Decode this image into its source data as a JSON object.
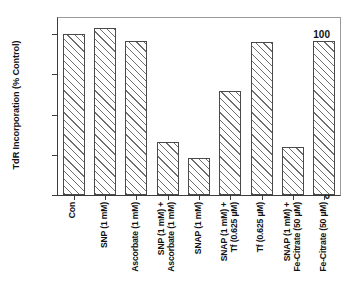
{
  "chart_data": {
    "type": "bar",
    "title": "",
    "xlabel": "",
    "ylabel": "TdR Incorporation (% Control)",
    "ylim": [
      0,
      110
    ],
    "yticks": [
      0,
      25,
      50,
      75,
      100
    ],
    "ytick_labels": [
      "0",
      "25",
      "50",
      "75",
      "100"
    ],
    "grid": false,
    "legend": null,
    "bar_fill": "white-with-diagonal-hatch",
    "categories": [
      "Con",
      "SNP (1 mM)",
      "Ascorbate (1 mM)",
      "SNP (1 mM) +\nAscorbate (1 mM)",
      "SNAP (1 mM)",
      "SNAP (1 mM) +\nTf (0.625 µM)",
      "Tf (0.625 µM)",
      "SNAP (1 mM) +\nFe-Citrate (50 µM)",
      "Fe-Citrate (50 µM)"
    ],
    "category_lines": [
      [
        "Con"
      ],
      [
        "SNP (1 mM)"
      ],
      [
        "Ascorbate (1 mM)"
      ],
      [
        "SNP (1 mM)  +",
        "Ascorbate (1 mM)"
      ],
      [
        "SNAP (1 mM)"
      ],
      [
        "SNAP (1 mM)  +",
        "Tf (0.625 µM)"
      ],
      [
        "Tf (0.625 µM)"
      ],
      [
        "SNAP (1 mM)  +",
        "Fe-Citrate (50 µM)"
      ],
      [
        "Fe-Citrate (50 µM)"
      ]
    ],
    "values": [
      100,
      104,
      96,
      33,
      23,
      64.5,
      95,
      30,
      96
    ]
  },
  "colors": {
    "axis": "#3c3c3c",
    "bar_edge": "#4a4a4a",
    "hatch": "#6e6e6e",
    "background": "#ffffff"
  }
}
